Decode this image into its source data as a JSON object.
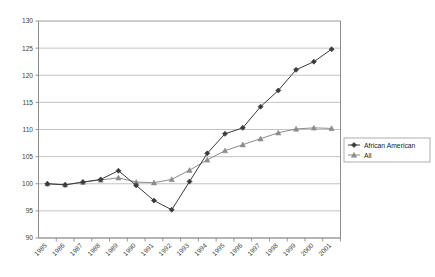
{
  "chart_data": {
    "type": "line",
    "title": "",
    "subtitle": "",
    "xlabel": "",
    "ylabel": "",
    "categories": [
      "1985",
      "1986",
      "1987",
      "1988",
      "1989",
      "1990",
      "1991",
      "1992",
      "1993",
      "1994",
      "1995",
      "1996",
      "1997",
      "1998",
      "1999",
      "2000",
      "2001"
    ],
    "ylim": [
      90,
      130
    ],
    "yticks": [
      90,
      95,
      100,
      105,
      110,
      115,
      120,
      125,
      130
    ],
    "ytick_labels": [
      "90",
      "95",
      "100",
      "105",
      "110",
      "115",
      "120",
      "125",
      "130"
    ],
    "grid": "horizontal",
    "legend_position": "right-middle",
    "xtick_label_rotation": 45,
    "series": [
      {
        "name": "African American",
        "marker": "diamond",
        "color": "#3b3b3b",
        "values": [
          100,
          99.8,
          100.3,
          100.8,
          102.4,
          99.7,
          96.9,
          95.2,
          100.4,
          105.6,
          109.2,
          110.3,
          114.2,
          117.2,
          121.0,
          122.5,
          124.8
        ]
      },
      {
        "name": "All",
        "marker": "triangle",
        "color": "#8c8c8c",
        "values": [
          100,
          99.8,
          100.3,
          100.7,
          101.1,
          100.3,
          100.2,
          100.8,
          102.5,
          104.4,
          106.1,
          107.2,
          108.3,
          109.4,
          110.1,
          110.3,
          110.2
        ]
      }
    ]
  },
  "legend": {
    "entries": [
      {
        "label": "African American"
      },
      {
        "label": "All"
      }
    ]
  },
  "colors": {
    "series_african_american": "#3b3b3b",
    "series_all": "#8c8c8c",
    "gridline": "#a9a9a9",
    "axis": "#808080",
    "background": "#ffffff"
  }
}
